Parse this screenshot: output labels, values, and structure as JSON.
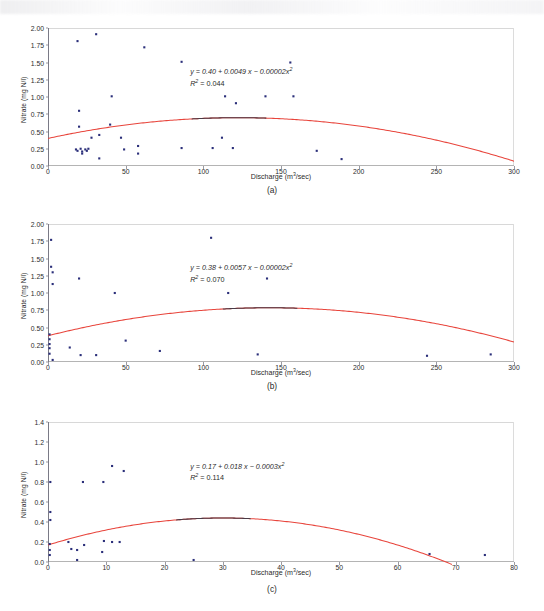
{
  "figure": {
    "panels": [
      {
        "caption": "(a)",
        "xlabel_text": "Discharge (m",
        "xlabel_sup": "3",
        "xlabel_tail": "/sec)",
        "ylabel": "Nitrate (mg N/l)",
        "equation": "y = 0.40 + 0.0049 x − 0.00002x",
        "equation_sup": "2",
        "r2_prefix": "R",
        "r2_sup": "2",
        "r2_value": " = 0.044",
        "xticks": [
          "0",
          "50",
          "100",
          "150",
          "200",
          "250",
          "300"
        ],
        "yticks": [
          "0.00",
          "0.25",
          "0.50",
          "0.75",
          "1.00",
          "1.25",
          "1.50",
          "1.75",
          "2.00"
        ]
      },
      {
        "caption": "(b)",
        "xlabel_text": "Discharge (m",
        "xlabel_sup": "3",
        "xlabel_tail": "/sec)",
        "ylabel": "Nitrate (mg N/l)",
        "equation": "y = 0.38 + 0.0057 x − 0.00002x",
        "equation_sup": "2",
        "r2_prefix": "R",
        "r2_sup": "2",
        "r2_value": " = 0.070",
        "xticks": [
          "0",
          "50",
          "100",
          "150",
          "200",
          "250",
          "300"
        ],
        "yticks": [
          "0.00",
          "0.25",
          "0.50",
          "0.75",
          "1.00",
          "1.25",
          "1.50",
          "1.75",
          "2.00"
        ]
      },
      {
        "caption": "(c)",
        "xlabel_text": "Discharge (m",
        "xlabel_sup": "3",
        "xlabel_tail": "/sec)",
        "ylabel": "Nitrate (mg N/l)",
        "equation": "y = 0.17 + 0.018 x − 0.0003x",
        "equation_sup": "2",
        "r2_prefix": "R",
        "r2_sup": "2",
        "r2_value": " = 0.114",
        "xticks": [
          "0",
          "10",
          "20",
          "30",
          "40",
          "50",
          "60",
          "70",
          "80"
        ],
        "yticks": [
          "0.0",
          "0.2",
          "0.4",
          "0.6",
          "0.8",
          "1.0",
          "1.2",
          "1.4"
        ]
      }
    ]
  },
  "colors": {
    "point": "#2b2f7a",
    "fit_curve": "#e8453c",
    "fit_curve_shadow": "#4a3a45",
    "axis": "#b4b4b4",
    "text": "#2b2b2b"
  },
  "chart_data": [
    {
      "type": "scatter",
      "panel": "a",
      "title": "",
      "xlabel": "Discharge (m3/sec)",
      "ylabel": "Nitrate (mg N/l)",
      "xlim": [
        0,
        300
      ],
      "ylim": [
        0,
        2.0
      ],
      "xticks": [
        0,
        50,
        100,
        150,
        200,
        250,
        300
      ],
      "yticks": [
        0.0,
        0.25,
        0.5,
        0.75,
        1.0,
        1.25,
        1.5,
        1.75,
        2.0
      ],
      "grid": false,
      "legend": "none",
      "annotation": "y = 0.40 + 0.0049 x - 0.00002x^2; R^2 = 0.044",
      "fit": {
        "type": "quadratic",
        "a": 0.4,
        "b": 0.0049,
        "c": -2e-05,
        "r2": 0.044,
        "color": "#e8453c"
      },
      "points": [
        {
          "x": 19,
          "y": 1.81
        },
        {
          "x": 31,
          "y": 1.91
        },
        {
          "x": 62,
          "y": 1.72
        },
        {
          "x": 86,
          "y": 1.51
        },
        {
          "x": 156,
          "y": 1.5
        },
        {
          "x": 41,
          "y": 1.01
        },
        {
          "x": 114,
          "y": 1.01
        },
        {
          "x": 140,
          "y": 1.01
        },
        {
          "x": 158,
          "y": 1.01
        },
        {
          "x": 121,
          "y": 0.91
        },
        {
          "x": 20,
          "y": 0.8
        },
        {
          "x": 20,
          "y": 0.57
        },
        {
          "x": 40,
          "y": 0.6
        },
        {
          "x": 33,
          "y": 0.45
        },
        {
          "x": 28,
          "y": 0.41
        },
        {
          "x": 47,
          "y": 0.41
        },
        {
          "x": 112,
          "y": 0.41
        },
        {
          "x": 58,
          "y": 0.29
        },
        {
          "x": 86,
          "y": 0.26
        },
        {
          "x": 106,
          "y": 0.26
        },
        {
          "x": 119,
          "y": 0.26
        },
        {
          "x": 173,
          "y": 0.22
        },
        {
          "x": 18,
          "y": 0.24
        },
        {
          "x": 19,
          "y": 0.22
        },
        {
          "x": 21,
          "y": 0.25
        },
        {
          "x": 22,
          "y": 0.21
        },
        {
          "x": 24,
          "y": 0.24
        },
        {
          "x": 25,
          "y": 0.22
        },
        {
          "x": 26,
          "y": 0.25
        },
        {
          "x": 22,
          "y": 0.18
        },
        {
          "x": 49,
          "y": 0.24
        },
        {
          "x": 58,
          "y": 0.18
        },
        {
          "x": 33,
          "y": 0.11
        },
        {
          "x": 189,
          "y": 0.1
        }
      ]
    },
    {
      "type": "scatter",
      "panel": "b",
      "title": "",
      "xlabel": "Discharge (m3/sec)",
      "ylabel": "Nitrate (mg N/l)",
      "xlim": [
        0,
        300
      ],
      "ylim": [
        0,
        2.0
      ],
      "xticks": [
        0,
        50,
        100,
        150,
        200,
        250,
        300
      ],
      "yticks": [
        0.0,
        0.25,
        0.5,
        0.75,
        1.0,
        1.25,
        1.5,
        1.75,
        2.0
      ],
      "grid": false,
      "legend": "none",
      "annotation": "y = 0.38 + 0.0057 x - 0.00002x^2; R^2 = 0.070",
      "fit": {
        "type": "quadratic",
        "a": 0.38,
        "b": 0.0057,
        "c": -2e-05,
        "r2": 0.07,
        "color": "#e8453c"
      },
      "points": [
        {
          "x": 105,
          "y": 1.8
        },
        {
          "x": 2,
          "y": 1.77
        },
        {
          "x": 2,
          "y": 1.38
        },
        {
          "x": 3,
          "y": 1.3
        },
        {
          "x": 3,
          "y": 1.13
        },
        {
          "x": 20,
          "y": 1.21
        },
        {
          "x": 43,
          "y": 1.0
        },
        {
          "x": 116,
          "y": 1.0
        },
        {
          "x": 141,
          "y": 1.21
        },
        {
          "x": 1,
          "y": 0.4
        },
        {
          "x": 1,
          "y": 0.33
        },
        {
          "x": 1,
          "y": 0.26
        },
        {
          "x": 1,
          "y": 0.2
        },
        {
          "x": 1,
          "y": 0.12
        },
        {
          "x": 14,
          "y": 0.21
        },
        {
          "x": 50,
          "y": 0.31
        },
        {
          "x": 72,
          "y": 0.16
        },
        {
          "x": 21,
          "y": 0.1
        },
        {
          "x": 31,
          "y": 0.1
        },
        {
          "x": 135,
          "y": 0.11
        },
        {
          "x": 244,
          "y": 0.09
        },
        {
          "x": 285,
          "y": 0.11
        },
        {
          "x": 3,
          "y": 0.03
        }
      ]
    },
    {
      "type": "scatter",
      "panel": "c",
      "title": "",
      "xlabel": "Discharge (m3/sec)",
      "ylabel": "Nitrate (mg N/l)",
      "xlim": [
        0,
        80
      ],
      "ylim": [
        0,
        1.4
      ],
      "xticks": [
        0,
        10,
        20,
        30,
        40,
        50,
        60,
        70,
        80
      ],
      "yticks": [
        0.0,
        0.2,
        0.4,
        0.6,
        0.8,
        1.0,
        1.2,
        1.4
      ],
      "grid": false,
      "legend": "none",
      "annotation": "y = 0.17 + 0.018 x - 0.0003x^2; R^2 = 0.114",
      "fit": {
        "type": "quadratic",
        "a": 0.17,
        "b": 0.018,
        "c": -0.0003,
        "r2": 0.114,
        "color": "#e8453c"
      },
      "points": [
        {
          "x": 11,
          "y": 0.96
        },
        {
          "x": 13,
          "y": 0.91
        },
        {
          "x": 6,
          "y": 0.8
        },
        {
          "x": 9.5,
          "y": 0.8
        },
        {
          "x": 0.4,
          "y": 0.8
        },
        {
          "x": 0.4,
          "y": 0.5
        },
        {
          "x": 0.4,
          "y": 0.42
        },
        {
          "x": 3.5,
          "y": 0.2
        },
        {
          "x": 6.2,
          "y": 0.17
        },
        {
          "x": 9.6,
          "y": 0.21
        },
        {
          "x": 12.3,
          "y": 0.2
        },
        {
          "x": 11,
          "y": 0.2
        },
        {
          "x": 4,
          "y": 0.13
        },
        {
          "x": 5,
          "y": 0.12
        },
        {
          "x": 9.3,
          "y": 0.1
        },
        {
          "x": 0.3,
          "y": 0.18
        },
        {
          "x": 0.3,
          "y": 0.12
        },
        {
          "x": 0.3,
          "y": 0.07
        },
        {
          "x": 5,
          "y": 0.02
        },
        {
          "x": 25,
          "y": 0.02
        },
        {
          "x": 65.5,
          "y": 0.08
        },
        {
          "x": 75,
          "y": 0.07
        }
      ]
    }
  ]
}
